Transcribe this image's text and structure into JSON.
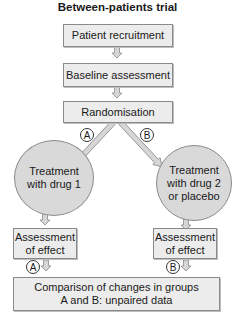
{
  "title": "Between-patients trial",
  "nodes": {
    "patient_recruitment": "Patient recruitment",
    "baseline_assessment": "Baseline assessment",
    "randomisation": "Randomisation",
    "treatment_a": "Treatment with drug 1",
    "treatment_b": "Treatment with drug 2 or placebo",
    "assessment_a": "Assessment of effect",
    "assessment_b": "Assessment of effect",
    "comparison_line1": "Comparison of changes in groups",
    "comparison_line2": "A and B: unpaired data"
  },
  "treatment_a_lines": [
    "Treatment",
    "with drug 1"
  ],
  "treatment_b_lines": [
    "Treatment",
    "with drug 2",
    "or placebo"
  ],
  "assessment_lines": [
    "Assessment",
    "of effect"
  ],
  "group_labels": {
    "a": "A",
    "b": "B"
  },
  "colors": {
    "box_fill": "#ececec",
    "circle_fill": "#d9d9d9",
    "border": "#8a8a8a",
    "arrow_fill": "#cfcfcf"
  }
}
